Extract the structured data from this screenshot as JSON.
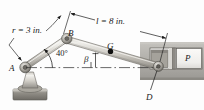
{
  "figure": {
    "background_color": "#fdfdfd",
    "ink_color": "#1a1a1a"
  },
  "labels": {
    "crank_radius": "r = 3 in.",
    "rod_length": "l = 8 in.",
    "point_b": "B",
    "point_a": "A",
    "point_g": "G",
    "point_d": "D",
    "force_p": "P",
    "angle_beta": "β",
    "angle_crank": "40°"
  },
  "geometry": {
    "point_a": {
      "x": 24,
      "y": 69
    },
    "point_b": {
      "x": 66,
      "y": 40
    },
    "point_g": {
      "x": 109,
      "y": 51
    },
    "point_d": {
      "x": 157,
      "y": 68
    },
    "crank_length_in": 3,
    "rod_length_in": 8,
    "crank_angle_deg": 40,
    "rod_angle_label": "β"
  },
  "parts": {
    "pedestal": {
      "name": "ground-pedestal"
    },
    "crank": {
      "name": "crank-link-ab"
    },
    "rod": {
      "name": "connecting-rod-bd"
    },
    "cylinder_block": {
      "name": "cylinder-housing"
    },
    "piston": {
      "name": "piston-head"
    },
    "centerline": {
      "name": "horizontal-centerline"
    }
  },
  "colors": {
    "metal_light": "#e4e2dd",
    "metal_mid": "#b9b6ae",
    "metal_dark": "#8e8b84",
    "block_gray": "#b0aea9",
    "block_gray_dark": "#97958f",
    "piston_white": "#f4f3f0",
    "ink": "#1a1a1a"
  }
}
